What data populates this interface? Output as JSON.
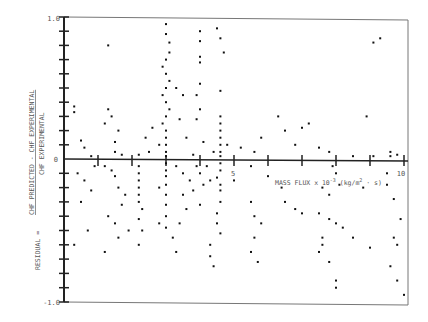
{
  "chart_data": {
    "type": "scatter",
    "title": "",
    "xlabel": "MASS FLUX x 10^-3 (kg/m^2 · s)",
    "ylabel": "RESIDUAL = (CHF PREDICTED − CHF EXPERIMENTAL) / CHF EXPERIMENTAL",
    "ylabel_prefix": "RESIDUAL =",
    "ylabel_numerator": "CHF PREDICTED − CHF EXPERIMENTAL",
    "ylabel_denominator": "CHF EXPERIMENTAL",
    "xlim": [
      0,
      10
    ],
    "ylim": [
      -1.0,
      1.0
    ],
    "x_tick_step": 1,
    "y_tick_step": 0.1,
    "x_tick_labels": [
      {
        "x": 5,
        "label": "5"
      },
      {
        "x": 10,
        "label": "10"
      }
    ],
    "y_tick_labels": [
      {
        "y": 1.0,
        "label": "1.0"
      },
      {
        "y": 0,
        "label": "0"
      },
      {
        "y": -1.0,
        "label": "-1.0"
      }
    ],
    "grid": false,
    "legend": null,
    "series": [
      {
        "name": "residuals",
        "points": [
          [
            0.3,
            0.37
          ],
          [
            0.3,
            0.33
          ],
          [
            0.5,
            0.13
          ],
          [
            0.6,
            0.08
          ],
          [
            0.8,
            0.02
          ],
          [
            0.9,
            -0.05
          ],
          [
            0.4,
            -0.1
          ],
          [
            0.6,
            -0.15
          ],
          [
            0.8,
            -0.22
          ],
          [
            0.5,
            -0.3
          ],
          [
            0.3,
            -0.6
          ],
          [
            0.7,
            -0.5
          ],
          [
            1.3,
            0.8
          ],
          [
            1.5,
            0.12
          ],
          [
            1.6,
            0.2
          ],
          [
            1.2,
            0.25
          ],
          [
            1.3,
            0.35
          ],
          [
            1.4,
            0.3
          ],
          [
            1.5,
            0.05
          ],
          [
            1.7,
            0.03
          ],
          [
            1.2,
            -0.05
          ],
          [
            1.4,
            -0.08
          ],
          [
            1.5,
            -0.12
          ],
          [
            1.6,
            -0.2
          ],
          [
            1.8,
            -0.25
          ],
          [
            1.7,
            -0.32
          ],
          [
            1.3,
            -0.4
          ],
          [
            1.5,
            -0.45
          ],
          [
            1.9,
            -0.5
          ],
          [
            1.6,
            -0.55
          ],
          [
            1.2,
            -0.65
          ],
          [
            2.2,
            0.03
          ],
          [
            2.2,
            -0.05
          ],
          [
            2.2,
            -0.1
          ],
          [
            2.2,
            -0.15
          ],
          [
            2.2,
            -0.2
          ],
          [
            2.2,
            -0.25
          ],
          [
            2.2,
            -0.3
          ],
          [
            2.3,
            -0.35
          ],
          [
            2.2,
            -0.42
          ],
          [
            2.3,
            -0.5
          ],
          [
            2.2,
            -0.6
          ],
          [
            2.4,
            0.15
          ],
          [
            2.6,
            0.22
          ],
          [
            2.8,
            0.1
          ],
          [
            2.5,
            0.05
          ],
          [
            3.0,
            0.95
          ],
          [
            3.0,
            0.88
          ],
          [
            3.1,
            0.82
          ],
          [
            3.1,
            0.75
          ],
          [
            3.0,
            0.7
          ],
          [
            2.9,
            0.65
          ],
          [
            3.0,
            0.6
          ],
          [
            3.1,
            0.55
          ],
          [
            3.0,
            0.5
          ],
          [
            2.9,
            0.45
          ],
          [
            3.0,
            0.4
          ],
          [
            3.1,
            0.35
          ],
          [
            3.0,
            0.3
          ],
          [
            2.9,
            0.25
          ],
          [
            3.0,
            0.2
          ],
          [
            3.0,
            0.15
          ],
          [
            3.0,
            0.1
          ],
          [
            3.0,
            0.05
          ],
          [
            3.0,
            0.02
          ],
          [
            3.0,
            -0.03
          ],
          [
            3.0,
            -0.08
          ],
          [
            3.0,
            -0.12
          ],
          [
            3.0,
            -0.18
          ],
          [
            3.0,
            -0.25
          ],
          [
            3.0,
            -0.32
          ],
          [
            3.0,
            -0.4
          ],
          [
            3.0,
            -0.48
          ],
          [
            3.2,
            -0.55
          ],
          [
            2.8,
            -0.45
          ],
          [
            2.8,
            -0.2
          ],
          [
            3.3,
            0.5
          ],
          [
            3.5,
            0.45
          ],
          [
            3.4,
            0.28
          ],
          [
            3.6,
            0.15
          ],
          [
            3.3,
            -0.05
          ],
          [
            3.5,
            -0.1
          ],
          [
            3.7,
            -0.15
          ],
          [
            3.5,
            -0.25
          ],
          [
            3.6,
            -0.35
          ],
          [
            3.4,
            -0.45
          ],
          [
            3.3,
            -0.65
          ],
          [
            4.0,
            0.9
          ],
          [
            4.0,
            0.83
          ],
          [
            4.0,
            0.72
          ],
          [
            4.0,
            0.68
          ],
          [
            4.0,
            0.53
          ],
          [
            3.9,
            0.45
          ],
          [
            4.0,
            0.35
          ],
          [
            3.9,
            0.28
          ],
          [
            4.1,
            0.12
          ],
          [
            3.8,
            0.03
          ],
          [
            3.9,
            -0.05
          ],
          [
            4.0,
            -0.1
          ],
          [
            4.1,
            -0.18
          ],
          [
            3.8,
            -0.22
          ],
          [
            4.0,
            -0.32
          ],
          [
            4.5,
            0.92
          ],
          [
            4.6,
            0.85
          ],
          [
            4.7,
            0.75
          ],
          [
            4.6,
            0.48
          ],
          [
            4.6,
            0.3
          ],
          [
            4.6,
            0.25
          ],
          [
            4.6,
            0.2
          ],
          [
            4.6,
            0.15
          ],
          [
            4.6,
            0.1
          ],
          [
            4.6,
            0.05
          ],
          [
            4.6,
            0.02
          ],
          [
            4.6,
            -0.03
          ],
          [
            4.6,
            -0.08
          ],
          [
            4.5,
            -0.13
          ],
          [
            4.6,
            -0.18
          ],
          [
            4.6,
            -0.22
          ],
          [
            4.6,
            -0.3
          ],
          [
            4.5,
            -0.38
          ],
          [
            4.5,
            -0.45
          ],
          [
            4.6,
            -0.52
          ],
          [
            4.3,
            -0.6
          ],
          [
            4.3,
            -0.68
          ],
          [
            4.4,
            -0.75
          ],
          [
            4.2,
            -0.05
          ],
          [
            4.3,
            -0.15
          ],
          [
            4.4,
            0.05
          ],
          [
            4.8,
            0.1
          ],
          [
            5.0,
            -0.15
          ],
          [
            5.2,
            0.08
          ],
          [
            5.6,
            0.05
          ],
          [
            5.8,
            0.15
          ],
          [
            6.3,
            0.3
          ],
          [
            5.5,
            -0.05
          ],
          [
            5.5,
            -0.3
          ],
          [
            5.6,
            -0.4
          ],
          [
            5.8,
            -0.45
          ],
          [
            5.6,
            -0.55
          ],
          [
            5.5,
            -0.65
          ],
          [
            5.7,
            -0.72
          ],
          [
            6.0,
            -0.12
          ],
          [
            6.4,
            -0.2
          ],
          [
            6.5,
            -0.3
          ],
          [
            6.8,
            -0.35
          ],
          [
            7.0,
            -0.38
          ],
          [
            6.5,
            0.2
          ],
          [
            6.8,
            0.1
          ],
          [
            7.0,
            0.22
          ],
          [
            7.2,
            0.25
          ],
          [
            7.5,
            0.08
          ],
          [
            7.8,
            0.05
          ],
          [
            7.9,
            -0.05
          ],
          [
            8.0,
            -0.1
          ],
          [
            7.6,
            -0.2
          ],
          [
            7.8,
            -0.25
          ],
          [
            8.1,
            -0.18
          ],
          [
            7.5,
            -0.38
          ],
          [
            7.8,
            -0.42
          ],
          [
            8.0,
            -0.45
          ],
          [
            8.2,
            -0.48
          ],
          [
            8.5,
            -0.55
          ],
          [
            7.5,
            -0.65
          ],
          [
            7.8,
            -0.72
          ],
          [
            7.6,
            -0.55
          ],
          [
            7.6,
            -0.6
          ],
          [
            8.0,
            -0.9
          ],
          [
            8.0,
            -0.85
          ],
          [
            9.1,
            0.82
          ],
          [
            9.3,
            0.85
          ],
          [
            8.5,
            0.02
          ],
          [
            8.8,
            -0.2
          ],
          [
            9.5,
            -0.1
          ],
          [
            9.5,
            -0.18
          ],
          [
            9.7,
            -0.28
          ],
          [
            9.0,
            -0.62
          ],
          [
            9.8,
            -0.6
          ],
          [
            9.7,
            -0.55
          ],
          [
            9.6,
            -0.75
          ],
          [
            9.8,
            -0.85
          ],
          [
            10.0,
            -0.95
          ],
          [
            9.9,
            -0.42
          ],
          [
            9.6,
            0.05
          ],
          [
            9.8,
            0.03
          ],
          [
            9.1,
            0.02
          ],
          [
            8.9,
            0.3
          ],
          [
            9.6,
            0.02
          ]
        ]
      }
    ]
  },
  "axis_labels": {
    "x": "MASS FLUX x 10",
    "x_exp": "-3",
    "x_unit": "(kg/m",
    "x_unit_exp": "2",
    "x_unit_tail": " · s)",
    "y_prefix": "RESIDUAL =",
    "y_num": "CHF PREDICTED - CHF EXPERIMENTAL",
    "y_den": "CHF EXPERIMENTAL",
    "y_top": "1.0",
    "y_zero": "0",
    "y_bottom": "-1.0",
    "x_five": "5",
    "x_ten": "10"
  }
}
